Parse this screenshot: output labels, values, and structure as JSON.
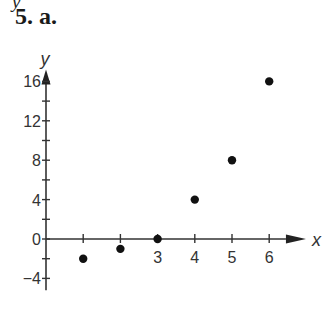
{
  "header": {
    "cut_text": "y        ",
    "problem_label": "5. a."
  },
  "chart_data": {
    "type": "scatter",
    "title": "5. a.",
    "xlabel": "x",
    "ylabel": "y",
    "x": [
      1,
      2,
      3,
      4,
      5,
      6
    ],
    "y": [
      -2,
      -1,
      0,
      4,
      8,
      16
    ],
    "xlim": [
      0,
      6.5
    ],
    "ylim": [
      -6,
      18
    ],
    "x_ticks": [
      1,
      2,
      3,
      4,
      5,
      6
    ],
    "x_tick_labels": [
      "",
      "",
      "3",
      "4",
      "5",
      "6"
    ],
    "y_ticks": [
      -4,
      -2,
      0,
      2,
      4,
      6,
      8,
      10,
      12,
      14,
      16
    ],
    "y_tick_labels": [
      "-4",
      "",
      "0",
      "",
      "4",
      "",
      "8",
      "",
      "12",
      "",
      "16"
    ],
    "grid": false,
    "legend": null,
    "point_color": "#111111",
    "axis_color": "#333333"
  }
}
